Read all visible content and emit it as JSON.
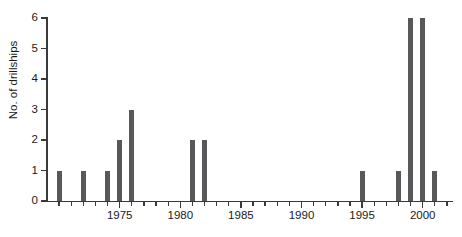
{
  "chart_data": {
    "type": "bar",
    "title": "",
    "xlabel": "",
    "ylabel": "No. of drillships",
    "xlim": [
      1969,
      2002.5
    ],
    "ylim": [
      0,
      6
    ],
    "grid": false,
    "legend": null,
    "bar_color": "#58585a",
    "axis_color": "#3a3a3a",
    "y_ticks": [
      0,
      1,
      2,
      3,
      4,
      5,
      6
    ],
    "y_tick_labels": [
      "0",
      "1",
      "2",
      "3",
      "4",
      "5",
      "6"
    ],
    "x_ticks": [
      1970,
      1971,
      1972,
      1973,
      1974,
      1975,
      1976,
      1977,
      1978,
      1979,
      1980,
      1981,
      1982,
      1983,
      1984,
      1985,
      1986,
      1987,
      1988,
      1989,
      1990,
      1991,
      1992,
      1993,
      1994,
      1995,
      1996,
      1997,
      1998,
      1999,
      2000,
      2001,
      2002
    ],
    "x_major_ticks": [
      1975,
      1980,
      1985,
      1990,
      1995,
      2000
    ],
    "x_tick_labels": [
      "1975",
      "1980",
      "1985",
      "1990",
      "1995",
      "2000"
    ],
    "categories": [
      1970,
      1971,
      1972,
      1973,
      1974,
      1975,
      1976,
      1977,
      1978,
      1979,
      1980,
      1981,
      1982,
      1983,
      1984,
      1985,
      1986,
      1987,
      1988,
      1989,
      1990,
      1991,
      1992,
      1993,
      1994,
      1995,
      1996,
      1997,
      1998,
      1999,
      2000,
      2001
    ],
    "values": [
      1,
      0,
      1,
      0,
      1,
      2,
      3,
      0,
      0,
      0,
      0,
      2,
      2,
      0,
      0,
      0,
      0,
      0,
      0,
      0,
      0,
      0,
      0,
      0,
      0,
      1,
      0,
      0,
      1,
      6,
      6,
      1
    ]
  }
}
